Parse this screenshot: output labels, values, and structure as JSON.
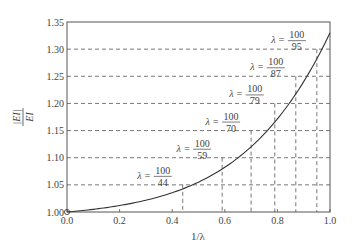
{
  "chart_data": {
    "type": "line",
    "title": "",
    "xlabel": "1/λ",
    "ylabel": "|EI| / EI",
    "ylabel_num": "|EI|",
    "ylabel_den": "EI",
    "xlim": [
      0.0,
      1.0
    ],
    "ylim": [
      1.0,
      1.35
    ],
    "xticks": [
      "0.0",
      "0.2",
      "0.4",
      "0.6",
      "0.8",
      "1.0"
    ],
    "yticks": [
      "1.00",
      "1.05",
      "1.10",
      "1.15",
      "1.20",
      "1.25",
      "1.30",
      "1.35"
    ],
    "grid": false,
    "series": [
      {
        "name": "|EI|/EI curve",
        "x": [
          0.0,
          0.1,
          0.2,
          0.3,
          0.4,
          0.5,
          0.6,
          0.7,
          0.8,
          0.9,
          1.0
        ],
        "y": [
          1.0,
          1.005,
          1.015,
          1.03,
          1.046,
          1.068,
          1.095,
          1.14,
          1.19,
          1.26,
          1.33
        ]
      }
    ],
    "annotations": [
      {
        "label": "λ = 100/44",
        "num": "100",
        "den": "44",
        "x": 0.44,
        "y": 1.05
      },
      {
        "label": "λ = 100/59",
        "num": "100",
        "den": "59",
        "x": 0.59,
        "y": 1.1
      },
      {
        "label": "λ = 100/70",
        "num": "100",
        "den": "70",
        "x": 0.7,
        "y": 1.15
      },
      {
        "label": "λ = 100/79",
        "num": "100",
        "den": "79",
        "x": 0.79,
        "y": 1.2
      },
      {
        "label": "λ = 100/87",
        "num": "100",
        "den": "87",
        "x": 0.87,
        "y": 1.25
      },
      {
        "label": "λ = 100/95",
        "num": "100",
        "den": "95",
        "x": 0.95,
        "y": 1.3
      }
    ],
    "reference_lines": "dashed horizontal at y=1.05..1.30 and dashed vertical at each annotated x",
    "origin_marker": "open circle at (0, 1.00)"
  }
}
